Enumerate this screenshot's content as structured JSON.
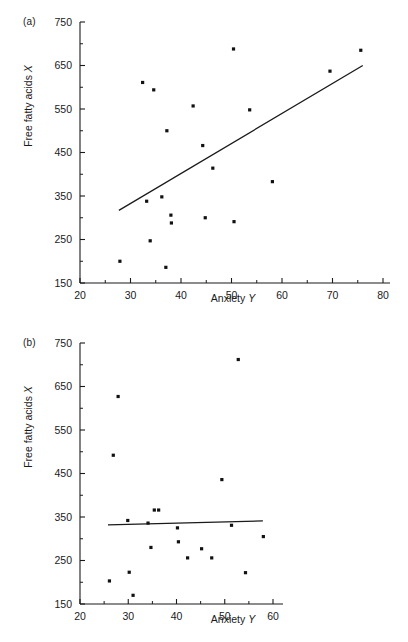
{
  "figure": {
    "panels": [
      {
        "tag": "(a)",
        "xlabel_text": "Anxiety",
        "xlabel_var": "Y",
        "ylabel_text": "Free fatty acids",
        "ylabel_var": "X"
      },
      {
        "tag": "(b)",
        "xlabel_text": "Anxiety",
        "xlabel_var": "Y",
        "ylabel_text": "Free fatty acids",
        "ylabel_var": "X"
      }
    ]
  },
  "chart_data": [
    {
      "type": "scatter",
      "panel": "(a)",
      "title": "",
      "xlabel": "Anxiety Y",
      "ylabel": "Free fatty acids X",
      "xlim": [
        20,
        80
      ],
      "ylim": [
        150,
        750
      ],
      "xticks": [
        20,
        30,
        40,
        50,
        60,
        70,
        80
      ],
      "xticklabels": [
        "20",
        "30",
        "40",
        "50",
        "60",
        "70",
        "80"
      ],
      "xminorticks": [
        25,
        35,
        45,
        55,
        65,
        75
      ],
      "yticks": [
        150,
        250,
        350,
        450,
        550,
        650,
        750
      ],
      "yticklabels": [
        "150",
        "250",
        "350",
        "450",
        "550",
        "650",
        "750"
      ],
      "yminorticks": [
        200,
        300,
        400,
        500,
        600,
        700
      ],
      "grid": false,
      "legend": null,
      "marker": "filled-square",
      "points": [
        {
          "x": 27.9,
          "y": 200
        },
        {
          "x": 32.4,
          "y": 611
        },
        {
          "x": 33.2,
          "y": 338
        },
        {
          "x": 33.9,
          "y": 247
        },
        {
          "x": 34.6,
          "y": 594
        },
        {
          "x": 36.2,
          "y": 348
        },
        {
          "x": 37.0,
          "y": 186
        },
        {
          "x": 37.2,
          "y": 500
        },
        {
          "x": 38.0,
          "y": 306
        },
        {
          "x": 38.1,
          "y": 288
        },
        {
          "x": 42.4,
          "y": 557
        },
        {
          "x": 44.3,
          "y": 466
        },
        {
          "x": 44.8,
          "y": 300
        },
        {
          "x": 46.3,
          "y": 414
        },
        {
          "x": 50.4,
          "y": 688
        },
        {
          "x": 50.5,
          "y": 291
        },
        {
          "x": 53.6,
          "y": 548
        },
        {
          "x": 58.1,
          "y": 383
        },
        {
          "x": 69.5,
          "y": 637
        },
        {
          "x": 75.6,
          "y": 685
        }
      ],
      "fit_line": {
        "x0": 27.7,
        "y0": 317,
        "x1": 76.0,
        "y1": 650
      }
    },
    {
      "type": "scatter",
      "panel": "(b)",
      "title": "",
      "xlabel": "Anxiety Y",
      "ylabel": "Free fatty acids X",
      "xlim": [
        20,
        63
      ],
      "ylim": [
        150,
        750
      ],
      "xticks": [
        20,
        30,
        40,
        50,
        60
      ],
      "xticklabels": [
        "20",
        "30",
        "40",
        "50",
        "60"
      ],
      "xminorticks": [
        25,
        35,
        45,
        55
      ],
      "yticks": [
        150,
        250,
        350,
        450,
        550,
        650,
        750
      ],
      "yticklabels": [
        "150",
        "250",
        "350",
        "450",
        "550",
        "650",
        "750"
      ],
      "yminorticks": [
        200,
        300,
        400,
        500,
        600,
        700
      ],
      "grid": false,
      "legend": null,
      "marker": "filled-square",
      "points": [
        {
          "x": 26.1,
          "y": 203
        },
        {
          "x": 26.9,
          "y": 492
        },
        {
          "x": 27.9,
          "y": 627
        },
        {
          "x": 29.9,
          "y": 342
        },
        {
          "x": 30.2,
          "y": 223
        },
        {
          "x": 31.0,
          "y": 170
        },
        {
          "x": 34.1,
          "y": 336
        },
        {
          "x": 34.7,
          "y": 280
        },
        {
          "x": 35.4,
          "y": 366
        },
        {
          "x": 36.3,
          "y": 366
        },
        {
          "x": 40.2,
          "y": 325
        },
        {
          "x": 40.4,
          "y": 293
        },
        {
          "x": 42.3,
          "y": 256
        },
        {
          "x": 45.2,
          "y": 277
        },
        {
          "x": 47.3,
          "y": 256
        },
        {
          "x": 49.4,
          "y": 436
        },
        {
          "x": 51.4,
          "y": 331
        },
        {
          "x": 52.8,
          "y": 712
        },
        {
          "x": 54.3,
          "y": 222
        },
        {
          "x": 58.0,
          "y": 305
        }
      ],
      "fit_line": {
        "x0": 25.8,
        "y0": 332,
        "x1": 57.9,
        "y1": 341
      }
    }
  ]
}
